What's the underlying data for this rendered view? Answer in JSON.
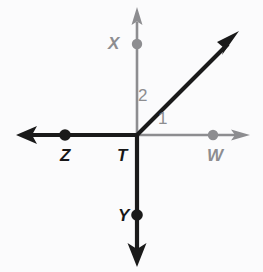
{
  "figure": {
    "kind": "geometry-ray-diagram",
    "background_color": "#fbfbfc",
    "width": 263,
    "height": 272,
    "vertex": "T"
  },
  "colors": {
    "dark_stroke": "#1a1a1a",
    "gray_stroke": "#8d8d90",
    "dark_label": "#171717",
    "gray_label": "#8d8d90",
    "background": "#fbfbfc"
  },
  "points": {
    "T": {
      "label": "T",
      "x": 137,
      "y": 135,
      "label_x": 117,
      "label_y": 147,
      "color": "#171717",
      "dot": false
    },
    "X": {
      "label": "X",
      "x": 137,
      "y": 44,
      "label_x": 108,
      "label_y": 35,
      "color": "#8d8d90",
      "dot": true,
      "dot_color": "#8d8d90"
    },
    "Y": {
      "label": "Y",
      "x": 137,
      "y": 215,
      "label_x": 118,
      "label_y": 207,
      "color": "#171717",
      "dot": true,
      "dot_color": "#1a1a1a"
    },
    "Z": {
      "label": "Z",
      "x": 65,
      "y": 135,
      "label_x": 60,
      "label_y": 147,
      "color": "#171717",
      "dot": true,
      "dot_color": "#1a1a1a"
    },
    "W": {
      "label": "W",
      "x": 213,
      "y": 135,
      "label_x": 207,
      "label_y": 147,
      "color": "#8d8d90",
      "dot": true,
      "dot_color": "#8d8d90"
    }
  },
  "rays": [
    {
      "name": "ray-TX-up",
      "from": "T",
      "through": "X",
      "tip_x": 137,
      "tip_y": 8,
      "color": "#8d8d90",
      "weight": "thin"
    },
    {
      "name": "ray-TY-down",
      "from": "T",
      "through": "Y",
      "tip_x": 137,
      "tip_y": 265,
      "color": "#1a1a1a",
      "weight": "thick"
    },
    {
      "name": "ray-TZ-left",
      "from": "T",
      "through": "Z",
      "tip_x": 18,
      "tip_y": 135,
      "color": "#1a1a1a",
      "weight": "thick"
    },
    {
      "name": "ray-TW-right",
      "from": "T",
      "through": "W",
      "tip_x": 248,
      "tip_y": 135,
      "color": "#8d8d90",
      "weight": "thin"
    },
    {
      "name": "ray-T-diagonal",
      "from": "T",
      "through": null,
      "tip_x": 237,
      "tip_y": 33,
      "color": "#1a1a1a",
      "weight": "thick"
    }
  ],
  "angles": [
    {
      "id": "angle-1",
      "label": "1",
      "label_x": 158,
      "label_y": 110,
      "color": "#8d8d90",
      "between": [
        "ray-T-diagonal",
        "ray-TW-right"
      ]
    },
    {
      "id": "angle-2",
      "label": "2",
      "label_x": 138,
      "label_y": 87,
      "color": "#8d8d90",
      "between": [
        "ray-TX-up",
        "ray-T-diagonal"
      ]
    }
  ]
}
